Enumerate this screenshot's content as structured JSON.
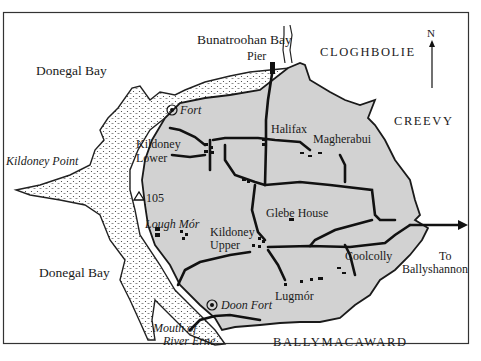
{
  "map": {
    "compass": {
      "label": "N"
    },
    "water": [
      {
        "id": "donegal-bay-north",
        "label": "Donegal Bay"
      },
      {
        "id": "donegal-bay-south",
        "label": "Donegal Bay"
      },
      {
        "id": "bunatroohan-bay",
        "label": "Bunatroohan Bay"
      }
    ],
    "townlands": [
      {
        "id": "cloghbolie",
        "label": "CLOGHBOLIE"
      },
      {
        "id": "creevy",
        "label": "CREEVY"
      },
      {
        "id": "ballymacaward",
        "label": "BALLYMACAWARD"
      }
    ],
    "places": [
      {
        "id": "pier",
        "label": "Pier"
      },
      {
        "id": "halifax",
        "label": "Halifax"
      },
      {
        "id": "magherabui",
        "label": "Magherabui"
      },
      {
        "id": "kildoney-lower-1",
        "label": "Kildoney"
      },
      {
        "id": "kildoney-lower-2",
        "label": "Lower"
      },
      {
        "id": "glebe-house",
        "label": "Glebe House"
      },
      {
        "id": "kildoney-upper-1",
        "label": "Kildoney"
      },
      {
        "id": "kildoney-upper-2",
        "label": "Upper"
      },
      {
        "id": "coolcolly",
        "label": "Coolcolly"
      },
      {
        "id": "lugmor",
        "label": "Lugmór"
      }
    ],
    "features": [
      {
        "id": "fort",
        "label": "Fort"
      },
      {
        "id": "doon-fort",
        "label": "Doon Fort"
      },
      {
        "id": "lough-mor",
        "label": "Lough Mór"
      },
      {
        "id": "kildoney-point",
        "label": "Kildoney Point"
      },
      {
        "id": "mouth-1",
        "label": "Mouth of"
      },
      {
        "id": "mouth-2",
        "label": "River Erne"
      },
      {
        "id": "spot-height",
        "label": "105"
      }
    ],
    "road_exit": {
      "line1": "To",
      "line2": "Ballyshannon"
    },
    "colors": {
      "land": "#d2d2d2",
      "ink": "#1a1a1a",
      "sea": "#ffffff",
      "dune": "#ffffff"
    }
  }
}
